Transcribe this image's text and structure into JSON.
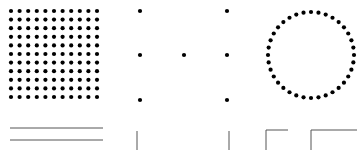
{
  "canvas": {
    "width": 362,
    "height": 150,
    "background": "#ffffff"
  },
  "colors": {
    "dot": "#000000",
    "line": "#555555"
  },
  "dot_grid": {
    "rows": 11,
    "cols": 11,
    "x0": 11,
    "y0": 11,
    "spacing": 8.6,
    "radius": 2.1
  },
  "sparse_dots": [
    [
      140,
      11
    ],
    [
      227,
      11
    ],
    [
      140,
      55
    ],
    [
      184,
      55
    ],
    [
      227,
      55
    ],
    [
      140,
      100
    ],
    [
      227,
      100
    ]
  ],
  "dot_circle": {
    "cx": 311,
    "cy": 55,
    "r": 43,
    "count": 36,
    "dot_radius": 2.1
  },
  "horizontal_lines": [
    {
      "x1": 10,
      "x2": 103,
      "y": 128
    },
    {
      "x1": 10,
      "x2": 103,
      "y": 140
    }
  ],
  "vertical_lines": [
    {
      "x": 137,
      "y1": 131,
      "y2": 150
    },
    {
      "x": 229,
      "y1": 131,
      "y2": 150
    }
  ],
  "corners": [
    {
      "x": 266,
      "y": 130,
      "w": 22,
      "h": 20
    },
    {
      "x": 311,
      "y": 130,
      "w": 46,
      "h": 20
    }
  ]
}
